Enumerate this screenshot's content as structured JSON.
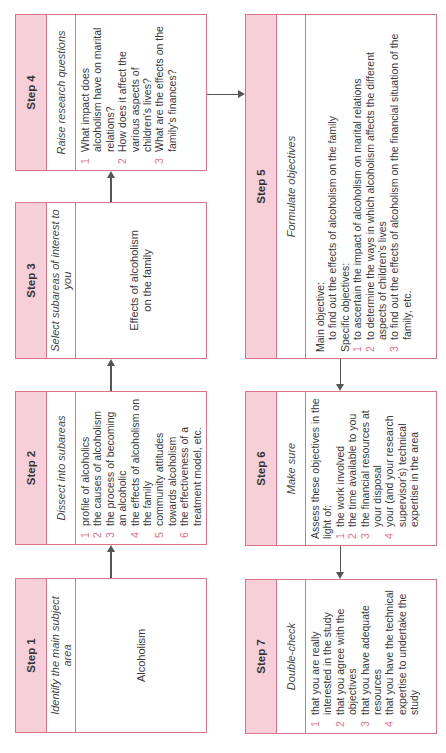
{
  "diagram": {
    "type": "flowchart",
    "orientation": "rotated-90-ccw",
    "colors": {
      "header_fill": "#f6cfd9",
      "border": "#d9738a",
      "number_color": "#d9738a",
      "arrow": "#555555"
    },
    "steps": [
      {
        "id": "step1",
        "title": "Step 1",
        "subtitle": "Identify the main subject area",
        "body": "Alcoholism"
      },
      {
        "id": "step2",
        "title": "Step 2",
        "subtitle": "Dissect into subareas",
        "items": [
          {
            "n": "1",
            "text": "profile of alcoholics"
          },
          {
            "n": "2",
            "text": "the causes of alcoholism"
          },
          {
            "n": "3",
            "text": "the process of becoming an alcoholic"
          },
          {
            "n": "4",
            "text": "the effects of alcoholism on the family"
          },
          {
            "n": "5",
            "text": "community attitudes towards alcoholism"
          },
          {
            "n": "6",
            "text": "the effectiveness of a treatment model, etc."
          }
        ]
      },
      {
        "id": "step3",
        "title": "Step 3",
        "subtitle": "Select subareas of interest to you",
        "body": "Effects of alcoholism on the family"
      },
      {
        "id": "step4",
        "title": "Step 4",
        "subtitle": "Raise research questions",
        "items": [
          {
            "n": "1",
            "text": "What impact does alcoholism have on marital relations?"
          },
          {
            "n": "2",
            "text": "How does it affect the various aspects of children's lives?"
          },
          {
            "n": "3",
            "text": "What are the effects on the family's finances?"
          }
        ]
      },
      {
        "id": "step5",
        "title": "Step 5",
        "subtitle": "Formulate objectives",
        "main_label": "Main objective:",
        "main_text": "to find out the effects of alcoholism on the family",
        "specific_label": "Specific objectives:",
        "items": [
          {
            "n": "1",
            "text": "to ascertain the impact of alcoholism on marital relations"
          },
          {
            "n": "2",
            "text": "to determine the ways in which alcoholism affects the different aspects of children's lives"
          },
          {
            "n": "3",
            "text": "to find out the effects of alcoholism on the financial situation of the family, etc."
          }
        ]
      },
      {
        "id": "step6",
        "title": "Step 6",
        "subtitle": "Make sure",
        "intro": "Assess these objectives in the light of:",
        "items": [
          {
            "n": "1",
            "text": "the work involved"
          },
          {
            "n": "2",
            "text": "the time available to you"
          },
          {
            "n": "3",
            "text": "the financial resources at your disposal"
          },
          {
            "n": "4",
            "text": "your (and your research supervisor's) technical expertise in the area"
          }
        ]
      },
      {
        "id": "step7",
        "title": "Step 7",
        "subtitle": "Double-check",
        "items": [
          {
            "n": "1",
            "text": "that you are really interested in the study"
          },
          {
            "n": "2",
            "text": "that you agree with the objectives"
          },
          {
            "n": "3",
            "text": "that you have adequate resources"
          },
          {
            "n": "4",
            "text": "that you have the technical expertise to undertake the study"
          }
        ]
      }
    ],
    "edges": [
      {
        "from": "step1",
        "to": "step2"
      },
      {
        "from": "step2",
        "to": "step3"
      },
      {
        "from": "step3",
        "to": "step4"
      },
      {
        "from": "step4",
        "to": "step5"
      },
      {
        "from": "step5",
        "to": "step6"
      },
      {
        "from": "step6",
        "to": "step7"
      }
    ]
  }
}
